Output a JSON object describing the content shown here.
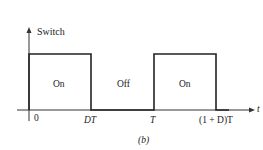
{
  "diagram": {
    "y_axis_label": "Switch",
    "x_axis_label": "t",
    "regions": [
      {
        "label": "On"
      },
      {
        "label": "Off"
      },
      {
        "label": "On"
      }
    ],
    "ticks": [
      "0",
      "DT",
      "T",
      "(1 + D)T"
    ],
    "caption": "(b)"
  }
}
